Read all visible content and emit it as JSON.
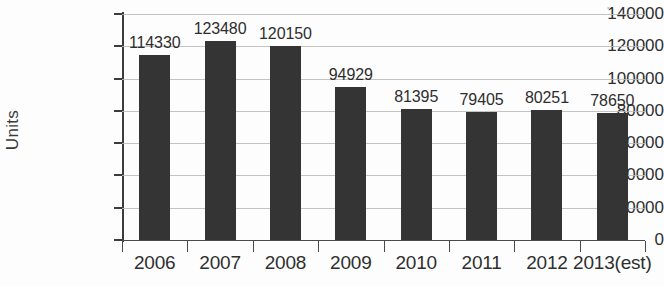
{
  "chart_data": {
    "type": "bar",
    "title": "",
    "xlabel": "",
    "ylabel": "Units",
    "categories": [
      "2006",
      "2007",
      "2008",
      "2009",
      "2010",
      "2011",
      "2012",
      "2013(est)"
    ],
    "values": [
      114330,
      123480,
      120150,
      94929,
      81395,
      79405,
      80251,
      78650
    ],
    "data_labels": [
      "114330",
      "123480",
      "120150",
      "94929",
      "81395",
      "79405",
      "80251",
      "78650"
    ],
    "ylim": [
      0,
      140000
    ],
    "ytick_values": [
      0,
      20000,
      40000,
      60000,
      80000,
      100000,
      120000,
      140000
    ],
    "ytick_labels": [
      "0",
      "20000",
      "40000",
      "60000",
      "80000",
      "100000",
      "120000",
      "140000"
    ],
    "grid": true,
    "legend": false,
    "legend_position": "none",
    "bar_color": "#343434",
    "grid_color": "#b9b9b9",
    "axis_color": "#3c3c3c",
    "background_color": "#fdfdfd"
  }
}
